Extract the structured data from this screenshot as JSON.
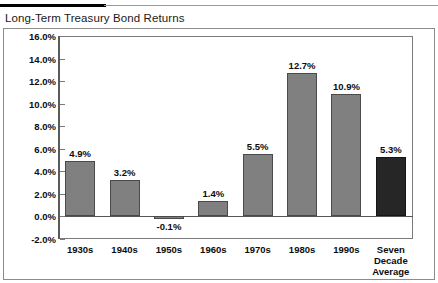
{
  "chart_data": {
    "type": "bar",
    "title": "Long-Term Treasury Bond Returns",
    "xlabel": "",
    "ylabel": "",
    "ylim": [
      -2.0,
      16.0
    ],
    "ytick_step": 2.0,
    "grid": false,
    "legend": "none",
    "value_suffix": "%",
    "categories": [
      "1930s",
      "1940s",
      "1950s",
      "1960s",
      "1970s",
      "1980s",
      "1990s",
      "Seven\nDecade\nAverage"
    ],
    "values": [
      4.9,
      3.2,
      -0.1,
      1.4,
      5.5,
      12.7,
      10.9,
      5.3
    ],
    "value_labels": [
      "4.9%",
      "3.2%",
      "-0.1%",
      "1.4%",
      "5.5%",
      "12.7%",
      "10.9%",
      "5.3%"
    ],
    "ytick_labels": [
      "16.0%",
      "14.0%",
      "12.0%",
      "10.0%",
      "8.0%",
      "6.0%",
      "4.0%",
      "2.0%",
      "0.0%",
      "-2.0%"
    ],
    "ytick_values": [
      16.0,
      14.0,
      12.0,
      10.0,
      8.0,
      6.0,
      4.0,
      2.0,
      0.0,
      -2.0
    ],
    "bar_colors": [
      "#808080",
      "#808080",
      "#808080",
      "#808080",
      "#808080",
      "#808080",
      "#808080",
      "#262626"
    ],
    "accent_index": 7,
    "accent_color": "#262626",
    "series_color": "#808080"
  }
}
